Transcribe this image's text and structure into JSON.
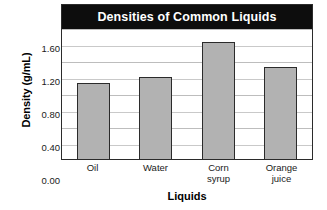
{
  "chart_data": {
    "type": "bar",
    "title": "Densities of Common Liquids",
    "xlabel": "Liquids",
    "ylabel": "Density (g/mL)",
    "categories": [
      "Oil",
      "Water",
      "Corn syrup",
      "Orange juice"
    ],
    "category_lines": [
      [
        "Oil"
      ],
      [
        "Water"
      ],
      [
        "Corn",
        "syrup"
      ],
      [
        "Orange",
        "juice"
      ]
    ],
    "values": [
      0.92,
      1.0,
      1.42,
      1.12
    ],
    "ylim": [
      0.0,
      1.6
    ],
    "ytick_labels": [
      "0.00",
      "0.40",
      "0.80",
      "1.20",
      "1.60"
    ],
    "ytick_values": [
      0.0,
      0.4,
      0.8,
      1.2,
      1.6
    ],
    "gridline_values": [
      0.2,
      0.4,
      0.6,
      0.8,
      1.0,
      1.2,
      1.4,
      1.6
    ],
    "grid": true,
    "legend": "none",
    "bar_fill_color": "#b2b2b2",
    "bar_border_color": "#2b2b2b",
    "title_banner_color": "#0d0d0d",
    "title_text_color": "#ffffff",
    "axis_color": "#2b2b2b",
    "gridline_color": "#c9c9c9"
  }
}
